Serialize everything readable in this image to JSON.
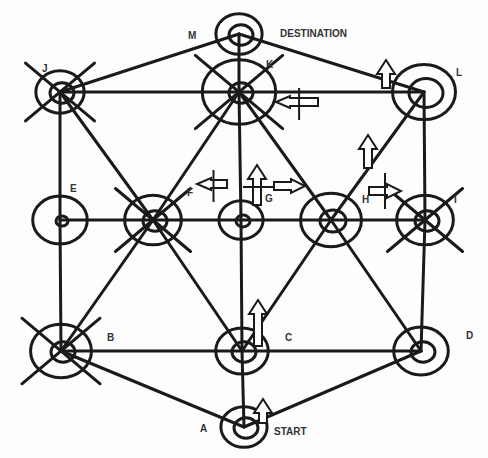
{
  "diagram": {
    "colors": {
      "stroke": "#1a1a1a",
      "label": "#333333",
      "background": "#fdfdfd"
    },
    "nodes": [
      {
        "id": "A",
        "label": "A",
        "x": 244,
        "y": 427,
        "outer": 22,
        "inner": 12,
        "lx": 200,
        "ly": 432,
        "annotation": "START",
        "ax": 274,
        "ay": 435,
        "crossed": false
      },
      {
        "id": "B",
        "label": "B",
        "x": 61,
        "y": 351,
        "outer": 29,
        "inner": 12,
        "lx": 107,
        "ly": 341,
        "crossed": true
      },
      {
        "id": "C",
        "label": "C",
        "x": 242,
        "y": 351,
        "outer": 25,
        "inner": 12,
        "lx": 285,
        "ly": 341,
        "crossed": false
      },
      {
        "id": "D",
        "label": "D",
        "x": 421,
        "y": 351,
        "outer": 26,
        "inner": 12,
        "lx": 466,
        "ly": 339,
        "crossed": false
      },
      {
        "id": "E",
        "label": "E",
        "x": 60,
        "y": 220,
        "outer": 26,
        "inner": 6,
        "lx": 70,
        "ly": 192,
        "crossed": false
      },
      {
        "id": "F",
        "label": "F",
        "x": 153,
        "y": 220,
        "outer": 27,
        "inner": 12,
        "lx": 187,
        "ly": 196,
        "crossed": true
      },
      {
        "id": "G",
        "label": "G",
        "x": 241,
        "y": 220,
        "outer": 21,
        "inner": 7,
        "lx": 265,
        "ly": 202,
        "crossed": false
      },
      {
        "id": "H",
        "label": "H",
        "x": 331,
        "y": 220,
        "outer": 29,
        "inner": 13,
        "lx": 362,
        "ly": 203,
        "crossed": false
      },
      {
        "id": "I",
        "label": "I",
        "x": 425,
        "y": 220,
        "outer": 27,
        "inner": 12,
        "lx": 454,
        "ly": 203,
        "crossed": true
      },
      {
        "id": "J",
        "label": "J",
        "x": 60,
        "y": 92,
        "outer": 23,
        "inner": 12,
        "lx": 42,
        "ly": 72,
        "crossed": true
      },
      {
        "id": "K",
        "label": "K",
        "x": 239,
        "y": 92,
        "outer": 35,
        "inner": 12,
        "lx": 266,
        "ly": 68,
        "crossed": true
      },
      {
        "id": "L",
        "label": "L",
        "x": 424,
        "y": 92,
        "outer": 30,
        "inner": 17,
        "lx": 456,
        "ly": 76,
        "crossed": false
      },
      {
        "id": "M",
        "label": "M",
        "x": 239,
        "y": 34,
        "outer": 22,
        "inner": 12,
        "lx": 188,
        "ly": 39,
        "annotation": "DESTINATION",
        "ax": 280,
        "ay": 37,
        "crossed": false
      }
    ],
    "edges": [
      [
        "J",
        "K"
      ],
      [
        "K",
        "L"
      ],
      [
        "J",
        "M"
      ],
      [
        "M",
        "L"
      ],
      [
        "M",
        "K"
      ],
      [
        "J",
        "E"
      ],
      [
        "E",
        "B"
      ],
      [
        "L",
        "I"
      ],
      [
        "I",
        "D"
      ],
      [
        "K",
        "G"
      ],
      [
        "G",
        "C"
      ],
      [
        "C",
        "A"
      ],
      [
        "E",
        "I"
      ],
      [
        "B",
        "C"
      ],
      [
        "C",
        "D"
      ],
      [
        "B",
        "A"
      ],
      [
        "D",
        "A"
      ],
      [
        "J",
        "F"
      ],
      [
        "F",
        "C"
      ],
      [
        "K",
        "F"
      ],
      [
        "F",
        "B"
      ],
      [
        "K",
        "H"
      ],
      [
        "H",
        "D"
      ],
      [
        "L",
        "H"
      ],
      [
        "H",
        "C"
      ]
    ],
    "arrows": [
      {
        "id": "arrow-up-near-L",
        "dir": "up",
        "x": 386,
        "y": 60,
        "len": 28,
        "crossbar": false
      },
      {
        "id": "arrow-left-near-K",
        "dir": "left",
        "x": 318,
        "y": 102,
        "len": 42,
        "crossbar": true
      },
      {
        "id": "arrow-up-near-L-lower",
        "dir": "up",
        "x": 368,
        "y": 135,
        "len": 33,
        "crossbar": false
      },
      {
        "id": "arrow-up-near-K-lower",
        "dir": "up",
        "x": 257,
        "y": 165,
        "len": 40,
        "crossbar": true
      },
      {
        "id": "arrow-left-near-F",
        "dir": "left",
        "x": 227,
        "y": 184,
        "len": 30,
        "crossbar": true
      },
      {
        "id": "arrow-right-near-G",
        "dir": "right",
        "x": 274,
        "y": 186,
        "len": 31,
        "crossbar": false
      },
      {
        "id": "arrow-right-near-H",
        "dir": "right",
        "x": 369,
        "y": 191,
        "len": 32,
        "crossbar": true
      },
      {
        "id": "arrow-up-near-G-lower",
        "dir": "up",
        "x": 258,
        "y": 300,
        "len": 46,
        "crossbar": false
      },
      {
        "id": "arrow-up-near-C",
        "dir": "up",
        "x": 263,
        "y": 399,
        "len": 24,
        "crossbar": false
      }
    ]
  }
}
